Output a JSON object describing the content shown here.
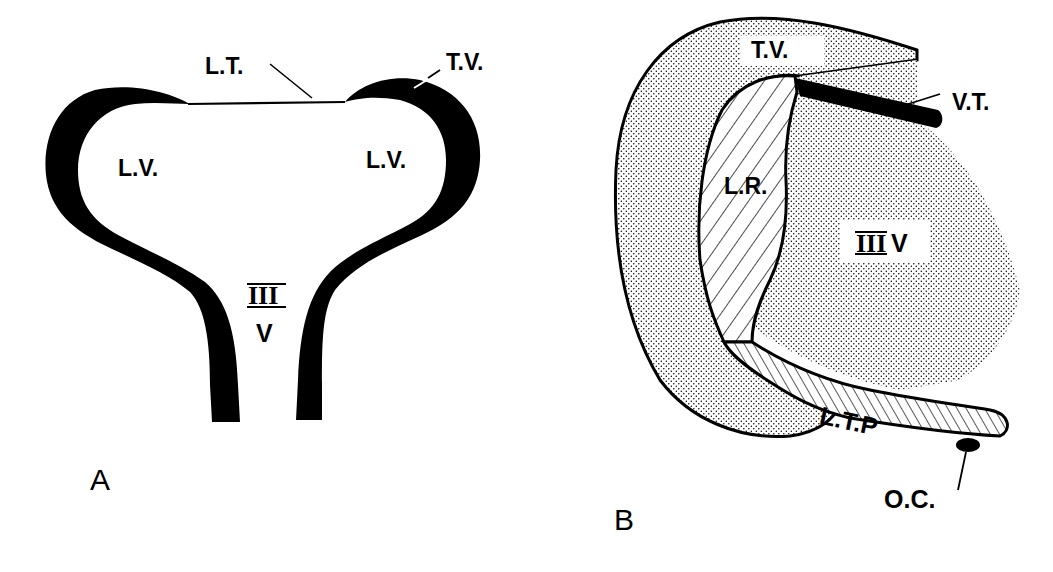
{
  "figure": {
    "panels": [
      {
        "id": "A",
        "panel_label": "A",
        "labels": {
          "lamina_terminalis": "L.T.",
          "telencephalic_vesicle": "T.V.",
          "lateral_ventricle_left": "L.V.",
          "lateral_ventricle_right": "L.V.",
          "third_ventricle_numeral": "III",
          "third_ventricle_letter": "V"
        }
      },
      {
        "id": "B",
        "panel_label": "B",
        "labels": {
          "telencephalic_vesicle": "T.V.",
          "velum_transversum": "V.T.",
          "lamina_reuniens": "L.R.",
          "third_ventricle_numeral": "III",
          "third_ventricle_letter": "V",
          "lamina_terminalis_plate": "L.T.P",
          "optic_chiasm": "O.C."
        }
      }
    ],
    "colors": {
      "ink": "#000000",
      "background": "#ffffff",
      "stipple": "#000000"
    }
  }
}
